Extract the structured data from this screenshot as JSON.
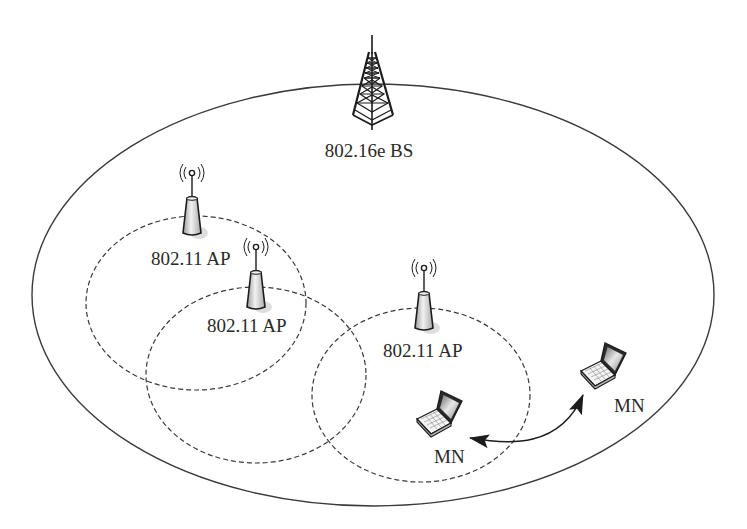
{
  "diagram": {
    "title": "",
    "base_station": {
      "label": "802.16e BS",
      "icon": "cell-tower-icon",
      "coverage": {
        "shape": "ellipse",
        "cx": 373,
        "cy": 295,
        "rx": 341,
        "ry": 211,
        "style": "solid"
      }
    },
    "access_points": [
      {
        "label": "802.11 AP",
        "icon": "wifi-access-point-icon",
        "icon_pos": {
          "x": 192,
          "y": 173
        },
        "label_pos": {
          "x": 151,
          "y": 265
        },
        "coverage": {
          "shape": "ellipse",
          "cx": 196,
          "cy": 303,
          "rx": 110,
          "ry": 87,
          "style": "dashed"
        }
      },
      {
        "label": "802.11 AP",
        "icon": "wifi-access-point-icon",
        "icon_pos": {
          "x": 256,
          "y": 245
        },
        "label_pos": {
          "x": 207,
          "y": 332
        },
        "coverage": {
          "shape": "ellipse",
          "cx": 256,
          "cy": 375,
          "rx": 110,
          "ry": 88,
          "style": "dashed"
        }
      },
      {
        "label": "802.11 AP",
        "icon": "wifi-access-point-icon",
        "icon_pos": {
          "x": 424,
          "y": 267
        },
        "label_pos": {
          "x": 383,
          "y": 357
        },
        "coverage": {
          "shape": "ellipse",
          "cx": 421,
          "cy": 395,
          "rx": 109,
          "ry": 87,
          "style": "dashed"
        }
      }
    ],
    "mobile_nodes": [
      {
        "label": "MN",
        "icon": "laptop-icon",
        "label_pos": {
          "x": 434,
          "y": 463
        }
      },
      {
        "label": "MN",
        "icon": "laptop-icon",
        "label_pos": {
          "x": 614,
          "y": 412
        }
      }
    ],
    "connections": [
      {
        "from": "MN (inside AP coverage)",
        "to": "MN (outside AP coverage)",
        "type": "curved double-headed arrow"
      }
    ],
    "colors": {
      "ink": "#1c1c1c",
      "background": "#ffffff",
      "device_fill": "#d9d9d9",
      "device_shadow": "#c4c4c4"
    }
  }
}
